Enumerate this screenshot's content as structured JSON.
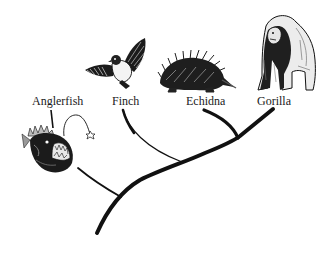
{
  "diagram": {
    "type": "phylogenetic-tree",
    "taxa": [
      {
        "id": "anglerfish",
        "label": "Anglerfish",
        "icon": "anglerfish-icon"
      },
      {
        "id": "finch",
        "label": "Finch",
        "icon": "finch-icon"
      },
      {
        "id": "echidna",
        "label": "Echidna",
        "icon": "echidna-icon"
      },
      {
        "id": "gorilla",
        "label": "Gorilla",
        "icon": "gorilla-icon"
      }
    ],
    "colors": {
      "line": "#111111",
      "background": "#ffffff",
      "text": "#1a1a1a"
    }
  }
}
